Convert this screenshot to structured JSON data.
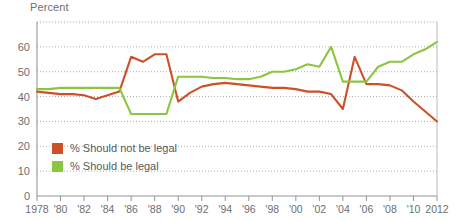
{
  "chart_data": {
    "type": "line",
    "title": "",
    "subtitle": "",
    "ylabel": "Percent",
    "xlabel": "",
    "ylim": [
      0,
      70
    ],
    "xlim": [
      1978,
      2012
    ],
    "grid": true,
    "legend_position": "inside-lower-left",
    "y_ticks": [
      0,
      10,
      20,
      30,
      40,
      50,
      60
    ],
    "y_tick_labels": [
      "0",
      "10",
      "20",
      "30",
      "40",
      "50",
      "60"
    ],
    "x_ticks": [
      1978,
      1980,
      1982,
      1984,
      1986,
      1988,
      1990,
      1992,
      1994,
      1996,
      1998,
      2000,
      2002,
      2004,
      2006,
      2008,
      2010,
      2012
    ],
    "x_tick_labels": [
      "1978",
      "'80",
      "'82",
      "'84",
      "'86",
      "'88",
      "'90",
      "'92",
      "'94",
      "'96",
      "'98",
      "'00",
      "'02",
      "'04",
      "'06",
      "'08",
      "'10",
      "2012"
    ],
    "x": [
      1978,
      1979,
      1980,
      1981,
      1982,
      1983,
      1984,
      1985,
      1986,
      1987,
      1988,
      1989,
      1990,
      1991,
      1992,
      1993,
      1994,
      1995,
      1996,
      1997,
      1998,
      1999,
      2000,
      2001,
      2002,
      2003,
      2004,
      2005,
      2006,
      2007,
      2008,
      2009,
      2010,
      2011,
      2012
    ],
    "series": [
      {
        "name": "% Should not be legal",
        "color": "#CC5128",
        "values": [
          42,
          41.5,
          41,
          41,
          40.5,
          39,
          40.5,
          42,
          56,
          54,
          57,
          57,
          38,
          41.5,
          44,
          45,
          45.5,
          45,
          44.5,
          44,
          43.5,
          43.5,
          43,
          42,
          42,
          41,
          35,
          56,
          45,
          45,
          44.5,
          42.5,
          38,
          34,
          30
        ]
      },
      {
        "name": "% Should be legal",
        "color": "#8CC63E",
        "values": [
          43,
          43,
          43.5,
          43.5,
          43.5,
          43.5,
          43.5,
          43.5,
          33,
          33,
          33,
          33,
          48,
          48,
          48,
          47.5,
          47.5,
          47,
          47,
          48,
          50,
          50,
          51,
          53,
          52,
          60,
          46,
          46,
          46,
          52,
          54,
          54,
          57,
          59,
          62
        ]
      }
    ],
    "legend": [
      {
        "label": "% Should not be legal",
        "color": "#CC5128"
      },
      {
        "label": "% Should be legal",
        "color": "#8CC63E"
      }
    ]
  },
  "colors": {
    "not_legal": "#CC5128",
    "legal": "#8CC63E",
    "grid": "#8a8a8a",
    "axis": "#939598",
    "text": "#6d6e71",
    "background": "#ffffff"
  }
}
